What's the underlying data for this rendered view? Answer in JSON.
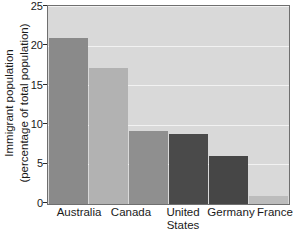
{
  "chart_data": {
    "type": "bar",
    "title": "",
    "xlabel": "",
    "ylabel": "Immigrant population (percentage of total population)",
    "ylabel_line1": "Immigrant population",
    "ylabel_line2": "(percentage of total population)",
    "categories": [
      "Australia",
      "Canada",
      "United States",
      "Germany",
      "France",
      "Japan"
    ],
    "values": [
      21.0,
      17.2,
      9.2,
      8.8,
      6.1,
      1.0
    ],
    "ylim": [
      0,
      25
    ],
    "yticks": [
      0,
      5,
      10,
      15,
      20,
      25
    ],
    "ytick_labels": [
      "0",
      "5",
      "10",
      "15",
      "20",
      "25"
    ],
    "grid": true,
    "grid_axis": "y",
    "legend": false,
    "bar_colors": [
      "#8a8a8a",
      "#b2b2b2",
      "#8f8f8f",
      "#4a4a4a",
      "#464646",
      "#bcbcbc"
    ],
    "plot_background": "#d9d9d9",
    "gridline_color": "#f2f2f2",
    "axis_color": "#6f6f6f",
    "text_color": "#1a1a1a"
  },
  "axis": {
    "y_title_line1": "Immigrant population",
    "y_title_line2": "(percentage of total population)",
    "tick_25": "25",
    "tick_20": "20",
    "tick_15": "15",
    "tick_10": "10",
    "tick_5": "5",
    "tick_0": "0"
  },
  "xaxis": {
    "australia": "Australia",
    "canada": "Canada",
    "united": "United",
    "states": "States",
    "germany": "Germany",
    "france": "France",
    "japan": "Japan"
  }
}
